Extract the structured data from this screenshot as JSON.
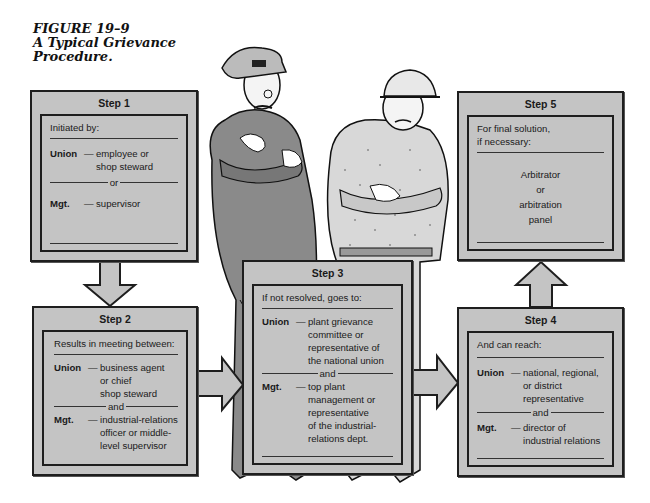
{
  "figure": {
    "number": "FIGURE 19–9",
    "caption_line1": "A Typical Grievance",
    "caption_line2": "Procedure."
  },
  "colors": {
    "box_fill": "#c4c4c4",
    "border": "#1e1e1e",
    "background": "#ffffff"
  },
  "steps": [
    {
      "title": "Step 1",
      "intro": "Initiated by:",
      "union_label": "Union",
      "union_text": [
        "employee or",
        "shop steward"
      ],
      "connector": "or",
      "mgt_label": "Mgt.",
      "mgt_text": [
        "supervisor"
      ]
    },
    {
      "title": "Step 2",
      "intro": "Results in meeting between:",
      "union_label": "Union",
      "union_text": [
        "business agent",
        "or chief",
        "shop steward"
      ],
      "connector": "and",
      "mgt_label": "Mgt.",
      "mgt_text": [
        "industrial-relations",
        "officer or middle-",
        "level supervisor"
      ]
    },
    {
      "title": "Step 3",
      "intro": "If not resolved, goes to:",
      "union_label": "Union",
      "union_text": [
        "plant grievance",
        "committee or",
        "representative of",
        "the national union"
      ],
      "connector": "and",
      "mgt_label": "Mgt.",
      "mgt_text": [
        "top plant",
        "management or",
        "representative",
        "of the industrial-",
        "relations dept."
      ]
    },
    {
      "title": "Step 4",
      "intro": "And can reach:",
      "union_label": "Union",
      "union_text": [
        "national, regional,",
        "or district",
        "representative"
      ],
      "connector": "and",
      "mgt_label": "Mgt.",
      "mgt_text": [
        "director of",
        "industrial relations"
      ]
    },
    {
      "title": "Step 5",
      "intro_line1": "For final solution,",
      "intro_line2": "if necessary:",
      "result": [
        "Arbitrator",
        "or",
        "arbitration",
        "panel"
      ]
    }
  ],
  "illustration": {
    "left_figure": "manager-in-cap",
    "right_figure": "worker-in-hardhat"
  }
}
